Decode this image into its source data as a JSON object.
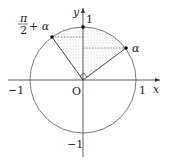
{
  "diagram": {
    "type": "unit-circle",
    "labels": {
      "x_axis": "x",
      "y_axis": "y",
      "origin": "O",
      "x_pos_one": "1",
      "x_neg_one": "−1",
      "y_pos_one": "1",
      "y_neg_one": "−1",
      "point_alpha": "α",
      "point_pi_half_num": "π",
      "point_pi_half_den": "2",
      "point_pi_half_suffix": "+ α"
    },
    "colors": {
      "stroke": "#333333",
      "shade": "#9a9a9a"
    }
  }
}
